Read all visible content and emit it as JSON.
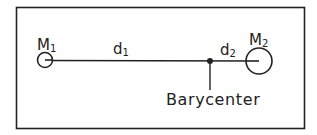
{
  "diagram": {
    "bodies": [
      {
        "label": "M",
        "subscript": "1"
      },
      {
        "label": "M",
        "subscript": "2"
      }
    ],
    "distances": [
      {
        "label": "d",
        "subscript": "1"
      },
      {
        "label": "d",
        "subscript": "2"
      }
    ],
    "barycenter_label": "Barycenter",
    "colors": {
      "ink": "#222222",
      "background": "#ffffff"
    }
  }
}
